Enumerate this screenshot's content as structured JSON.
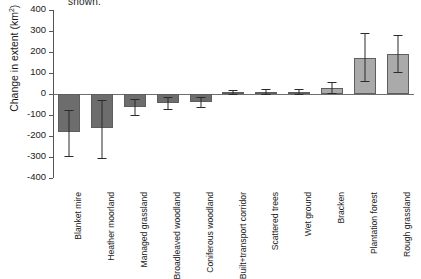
{
  "caption_fragment": "shown.",
  "chart_data": {
    "type": "bar",
    "title": "",
    "xlabel": "",
    "ylabel": "Change in extent (km²)",
    "ylabel_text": "Change in extent (km",
    "ylabel_sup": "2",
    "ylabel_tail": ")",
    "ylim": [
      -400,
      400
    ],
    "ytick_values": [
      400,
      300,
      200,
      100,
      0,
      -100,
      -200,
      -300,
      -400
    ],
    "ytick_labels": [
      "400",
      "300",
      "200",
      "100",
      "0",
      "-100",
      "-200",
      "-300",
      "-400"
    ],
    "grid": false,
    "legend": "none",
    "zero_line": true,
    "categories": [
      "Blanket mire",
      "Heather moorland",
      "Managed grassland",
      "Broadleaved woodland",
      "Coniferous woodland",
      "Built+transport corridor",
      "Scattered trees",
      "Wet ground",
      "Bracken",
      "Plantation forest",
      "Rough grassland"
    ],
    "values": [
      -180,
      -163,
      -62,
      -42,
      -38,
      8,
      9,
      10,
      30,
      170,
      190
    ],
    "error_low": [
      -295,
      -305,
      -100,
      -72,
      -62,
      -2,
      0,
      0,
      5,
      62,
      105
    ],
    "error_high": [
      -75,
      -27,
      -25,
      -15,
      -12,
      20,
      22,
      22,
      58,
      290,
      280
    ],
    "colors": {
      "negative_bar": "#6d6d6d",
      "positive_bar": "#aaaaaa",
      "bar_edge": "#5e5e5e",
      "error_bar": "#2b2b2b",
      "axis": "#555555",
      "zero_line": "#6e6e6e",
      "text": "#1a1a1a"
    }
  }
}
